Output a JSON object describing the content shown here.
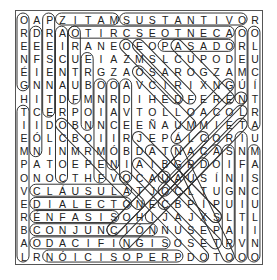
{
  "puzzle": {
    "rows": 19,
    "cols": 19,
    "grid": [
      [
        "O",
        "A",
        "P",
        "Z",
        "I",
        "T",
        "A",
        "M",
        "S",
        "U",
        "S",
        "T",
        "A",
        "N",
        "T",
        "I",
        "V",
        "O",
        "R"
      ],
      [
        "R",
        "D",
        "R",
        "A",
        "O",
        "T",
        "I",
        "R",
        "C",
        "S",
        "E",
        "O",
        "T",
        "N",
        "E",
        "C",
        "A",
        "O",
        "O"
      ],
      [
        "E",
        "E",
        "E",
        "I",
        "R",
        "A",
        "N",
        "E",
        "O",
        "E",
        "O",
        "P",
        "A",
        "S",
        "A",
        "D",
        "O",
        "R",
        "L"
      ],
      [
        "N",
        "F",
        "S",
        "C",
        "U",
        "E",
        "I",
        "A",
        "Z",
        "M",
        "S",
        "L",
        "C",
        "U",
        "P",
        "O",
        "D",
        "E",
        "U"
      ],
      [
        "É",
        "I",
        "E",
        "N",
        "T",
        "R",
        "G",
        "Z",
        "A",
        "O",
        "S",
        "A",
        "R",
        "O",
        "G",
        "Z",
        "A",
        "M",
        "C"
      ],
      [
        "G",
        "N",
        "N",
        "A",
        "U",
        "B",
        "O",
        "O",
        "A",
        "V",
        "C",
        "I",
        "R",
        "I",
        "X",
        "N",
        "G",
        "Ú",
        "Í"
      ],
      [
        "H",
        "I",
        "T",
        "D",
        "F",
        "M",
        "N",
        "R",
        "D",
        "I",
        "H",
        "E",
        "D",
        "F",
        "E",
        "R",
        "E",
        "N",
        "T"
      ],
      [
        "T",
        "C",
        "E",
        "R",
        "P",
        "O",
        "I",
        "A",
        "V",
        "T",
        "O",
        "L",
        "L",
        "O",
        "A",
        "C",
        "O",
        "L",
        "R"
      ],
      [
        "I",
        "I",
        "D",
        "O",
        "B",
        "N",
        "N",
        "C",
        "E",
        "E",
        "Ñ",
        "A",
        "U",
        "M",
        "M",
        "I",
        "E",
        "T",
        "A"
      ],
      [
        "E",
        "Ó",
        "L",
        "C",
        "B",
        "O",
        "I",
        "I",
        "R",
        "J",
        "E",
        "P",
        "Á",
        "L",
        "C",
        "O",
        "R",
        "I",
        "U"
      ],
      [
        "M",
        "N",
        "I",
        "N",
        "M",
        "R",
        "M",
        "Ó",
        "B",
        "D",
        "A",
        "T",
        "N",
        "A",
        "C",
        "A",
        "S",
        "N",
        "M"
      ],
      [
        "P",
        "A",
        "T",
        "O",
        "E",
        "P",
        "E",
        "N",
        "I",
        "A",
        "I",
        "B",
        "G",
        "R",
        "D",
        "O",
        "I",
        "F",
        "A"
      ],
      [
        "O",
        "N",
        "O",
        "C",
        "T",
        "H",
        "F",
        "V",
        "O",
        "C",
        "A",
        "U",
        "A",
        "U",
        "S",
        "Í",
        "N",
        "I",
        "S"
      ],
      [
        "V",
        "C",
        "L",
        "Á",
        "U",
        "S",
        "U",
        "L",
        "A",
        "T",
        "J",
        "O",
        "C",
        "L",
        "T",
        "U",
        "G",
        "N",
        "C"
      ],
      [
        "E",
        "D",
        "I",
        "A",
        "L",
        "E",
        "C",
        "T",
        "O",
        "N",
        "E",
        "C",
        "B",
        "P",
        "Í",
        "P",
        "U",
        "I",
        "U"
      ],
      [
        "R",
        "É",
        "N",
        "F",
        "A",
        "S",
        "I",
        "S",
        "O",
        "H",
        "I",
        "J",
        "A",
        "J",
        "X",
        "S",
        "L",
        "T",
        "L"
      ],
      [
        "B",
        "C",
        "O",
        "N",
        "J",
        "U",
        "N",
        "C",
        "I",
        "Ó",
        "N",
        "N",
        "U",
        "S",
        "E",
        "P",
        "A",
        "I",
        "I"
      ],
      [
        "A",
        "O",
        "D",
        "A",
        "C",
        "I",
        "F",
        "I",
        "N",
        "G",
        "I",
        "S",
        "O",
        "S",
        "E",
        "T",
        "R",
        "V",
        "N"
      ],
      [
        "L",
        "R",
        "N",
        "Ó",
        "I",
        "C",
        "I",
        "S",
        "O",
        "P",
        "E",
        "R",
        "P",
        "D",
        "O",
        "T",
        "O",
        "O",
        "O"
      ]
    ],
    "found_words": [
      {
        "word": "MATIZ",
        "r1": 1,
        "c1": 4,
        "r2": 1,
        "c2": 8
      },
      {
        "word": "SUSTANTIVO",
        "r1": 1,
        "c1": 9,
        "r2": 1,
        "c2": 18
      },
      {
        "word": "ACENTO ESCRITO",
        "r1": 2,
        "c1": 5,
        "r2": 2,
        "c2": 17
      },
      {
        "word": "PASADO",
        "r1": 3,
        "c1": 12,
        "r2": 3,
        "c2": 17
      },
      {
        "word": "CLÁUSULA",
        "r1": 14,
        "c1": 2,
        "r2": 14,
        "c2": 9
      },
      {
        "word": "DIALECTO",
        "r1": 15,
        "c1": 2,
        "r2": 15,
        "c2": 9
      },
      {
        "word": "ÉNFASIS",
        "r1": 16,
        "c1": 2,
        "r2": 16,
        "c2": 8
      },
      {
        "word": "CONJUNCIÓN",
        "r1": 17,
        "c1": 2,
        "r2": 17,
        "c2": 11
      },
      {
        "word": "SIGNIFICADO",
        "r1": 18,
        "c1": 2,
        "r2": 18,
        "c2": 12
      },
      {
        "word": "PREPOSICIÓN",
        "r1": 19,
        "c1": 3,
        "r2": 19,
        "c2": 13
      },
      {
        "word": "GÉNERO",
        "r1": 1,
        "c1": 1,
        "r2": 6,
        "c2": 1
      },
      {
        "word": "TIEMPO VERBAL",
        "r1": 8,
        "c1": 1,
        "r2": 19,
        "c2": 1
      },
      {
        "word": "DEFINICIÓN",
        "r1": 2,
        "c1": 2,
        "r2": 11,
        "c2": 2
      },
      {
        "word": "PRESENTE",
        "r1": 1,
        "c1": 3,
        "r2": 8,
        "c2": 3
      },
      {
        "word": "CONCORDANCIA",
        "r1": 2,
        "c1": 4,
        "r2": 13,
        "c2": 4
      },
      {
        "word": "FUTURO",
        "r1": 2,
        "c1": 5,
        "r2": 7,
        "c2": 5
      },
      {
        "word": "NOMBRE",
        "r1": 4,
        "c1": 6,
        "r2": 9,
        "c2": 6
      },
      {
        "word": "FEMENINO",
        "r1": 6,
        "c1": 7,
        "r2": 13,
        "c2": 7
      },
      {
        "word": "ORACIÓN",
        "r1": 6,
        "c1": 8,
        "r2": 12,
        "c2": 8
      },
      {
        "word": "ADVERBIO",
        "r1": 6,
        "c1": 9,
        "r2": 13,
        "c2": 9
      },
      {
        "word": "NÚMERO",
        "r1": 2,
        "c1": 18,
        "r2": 7,
        "c2": 18
      },
      {
        "word": "ARTÍCULO",
        "r1": 2,
        "c1": 19,
        "r2": 9,
        "c2": 19
      },
      {
        "word": "SINGULAR",
        "r1": 11,
        "c1": 17,
        "r2": 18,
        "c2": 17
      },
      {
        "word": "INFINITIVO",
        "r1": 10,
        "c1": 18,
        "r2": 19,
        "c2": 18
      },
      {
        "word": "MASCULINO",
        "r1": 11,
        "c1": 19,
        "r2": 19,
        "c2": 19
      },
      {
        "word": "diag-1",
        "r1": 3,
        "c1": 9,
        "r2": 7,
        "c2": 13
      },
      {
        "word": "diag-2",
        "r1": 3,
        "c1": 10,
        "r2": 7,
        "c2": 14
      },
      {
        "word": "diag-3",
        "r1": 3,
        "c1": 13,
        "r2": 7,
        "c2": 17
      },
      {
        "word": "diag-4",
        "r1": 5,
        "c1": 10,
        "r2": 9,
        "c2": 14
      },
      {
        "word": "diag-5",
        "r1": 6,
        "c1": 17,
        "r2": 10,
        "c2": 13
      },
      {
        "word": "diag-6",
        "r1": 7,
        "c1": 18,
        "r2": 13,
        "c2": 12
      },
      {
        "word": "diag-7",
        "r1": 8,
        "c1": 18,
        "r2": 14,
        "c2": 12
      },
      {
        "word": "diag-8",
        "r1": 9,
        "c1": 18,
        "r2": 15,
        "c2": 12
      },
      {
        "word": "diag-9",
        "r1": 9,
        "c1": 4,
        "r2": 15,
        "c2": 10
      },
      {
        "word": "diag-10",
        "r1": 10,
        "c1": 10,
        "r2": 16,
        "c2": 16
      },
      {
        "word": "diag-11",
        "r1": 11,
        "c1": 11,
        "r2": 16,
        "c2": 16
      },
      {
        "word": "diag-12",
        "r1": 12,
        "c1": 10,
        "r2": 18,
        "c2": 16
      },
      {
        "word": "diag-13",
        "r1": 13,
        "c1": 9,
        "r2": 19,
        "c2": 15
      },
      {
        "word": "diag-14",
        "r1": 11,
        "c1": 13,
        "r2": 19,
        "c2": 17
      },
      {
        "word": "diag-15",
        "r1": 10,
        "c1": 15,
        "r2": 17,
        "c2": 8
      },
      {
        "word": "diag-16",
        "r1": 11,
        "c1": 16,
        "r2": 18,
        "c2": 9
      },
      {
        "word": "diag-17",
        "r1": 12,
        "c1": 15,
        "r2": 16,
        "c2": 11
      },
      {
        "word": "diag-18",
        "r1": 13,
        "c1": 12,
        "r2": 17,
        "c2": 8
      }
    ],
    "circle_color": "#333333",
    "letter_color": "#222222"
  }
}
